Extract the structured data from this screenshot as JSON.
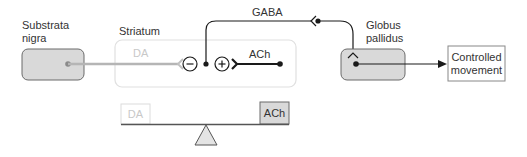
{
  "nodes": {
    "substantia_nigra": {
      "label_line1": "Substrata",
      "label_line2": "nigra"
    },
    "striatum": {
      "label": "Striatum",
      "da_label": "DA",
      "ach_label": "ACh",
      "minus_symbol": "−",
      "plus_symbol": "+"
    },
    "globus_pallidus": {
      "label_line1": "Globus",
      "label_line2": "pallidus"
    },
    "output": {
      "label_line1": "Controlled",
      "label_line2": "movement"
    }
  },
  "connections": {
    "gaba_label": "GABA"
  },
  "balance": {
    "left_label": "DA",
    "right_label": "ACh"
  },
  "colors": {
    "gray_box_fill": "#d9d9d9",
    "gray_box_stroke": "#6b6b6b",
    "striatum_stroke": "#e0e0e0",
    "da_pathway": "#b5b5b5",
    "line_dark": "#1a1a1a",
    "faint_text": "#c8c8c8"
  }
}
